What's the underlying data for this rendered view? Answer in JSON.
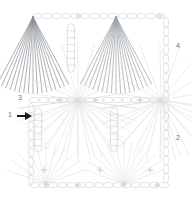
{
  "document": {
    "kind": "crochet-stitch-chart",
    "background_color": "#ffffff"
  },
  "colors": {
    "light_stitch": "#d9dce0",
    "mid_stitch": "#c6cace",
    "dark_stitch": "#9ba0a6",
    "darkest_stitch": "#8a8f95",
    "label_text": "#6f6f6f",
    "arrow": "#1a1a1a"
  },
  "labels": [
    {
      "id": "round-4",
      "text": "4",
      "x": 176,
      "y": 42
    },
    {
      "id": "round-3",
      "text": "3",
      "x": 18,
      "y": 94
    },
    {
      "id": "round-1",
      "text": "1",
      "x": 8,
      "y": 111
    },
    {
      "id": "round-2",
      "text": "2",
      "x": 176,
      "y": 134
    }
  ],
  "markers": [
    {
      "id": "start-arrow",
      "name": "start-direction-arrow",
      "x": 17,
      "y": 116,
      "direction": "right"
    }
  ],
  "chart_data": {
    "type": "diagram",
    "title": "",
    "xlabel": "",
    "ylabel": "",
    "rounds": [
      {
        "number": 1,
        "label": "1",
        "position": "left-middle",
        "note": "start round, marked by arrow"
      },
      {
        "number": 2,
        "label": "2",
        "position": "right-bottom",
        "note": ""
      },
      {
        "number": 3,
        "label": "3",
        "position": "left-upper",
        "note": ""
      },
      {
        "number": 4,
        "label": "4",
        "position": "right-upper",
        "note": ""
      }
    ],
    "fan_centers": [
      {
        "id": "fan-top-left",
        "x": 33,
        "y": 17,
        "spread": "down",
        "rays": 17,
        "tone": "dark"
      },
      {
        "id": "fan-top-right",
        "x": 116,
        "y": 17,
        "spread": "down",
        "rays": 17,
        "tone": "mid"
      },
      {
        "id": "fan-mid-left",
        "x": 78,
        "y": 100,
        "spread": "all",
        "rays": 22,
        "tone": "light"
      },
      {
        "id": "fan-mid-right",
        "x": 161,
        "y": 100,
        "spread": "all",
        "rays": 18,
        "tone": "light"
      },
      {
        "id": "fan-bottom-left",
        "x": 46,
        "y": 184,
        "spread": "up",
        "rays": 11,
        "tone": "light"
      },
      {
        "id": "fan-bottom-right",
        "x": 124,
        "y": 184,
        "spread": "up",
        "rays": 13,
        "tone": "light"
      }
    ],
    "chain_rows": [
      {
        "id": "chain-row-top",
        "y": 16,
        "x1": 33,
        "x2": 165,
        "links": 14
      },
      {
        "id": "chain-row-middle",
        "y": 100,
        "x1": 30,
        "x2": 168,
        "links": 15
      },
      {
        "id": "chain-row-bottom",
        "y": 185,
        "x1": 30,
        "x2": 168,
        "links": 15
      }
    ],
    "chain_columns": [
      {
        "id": "chain-col-left",
        "x": 31,
        "y1": 104,
        "y2": 184,
        "links": 9
      },
      {
        "id": "chain-col-right",
        "x": 166,
        "y1": 18,
        "y2": 100,
        "links": 9
      },
      {
        "id": "chain-col-right-lower",
        "x": 166,
        "y1": 104,
        "y2": 182,
        "links": 9
      }
    ],
    "post_stitches": [
      {
        "id": "post-upper-center",
        "x": 71,
        "y1": 24,
        "y2": 72,
        "bars": 6
      },
      {
        "id": "post-lower-left",
        "x": 38,
        "y1": 108,
        "y2": 152,
        "bars": 6
      },
      {
        "id": "post-lower-center",
        "x": 114,
        "y1": 108,
        "y2": 152,
        "bars": 6
      }
    ],
    "plus_marks": [
      {
        "x": 78,
        "y": 16
      },
      {
        "x": 160,
        "y": 16
      },
      {
        "x": 60,
        "y": 100
      },
      {
        "x": 96,
        "y": 100
      },
      {
        "x": 140,
        "y": 100
      },
      {
        "x": 46,
        "y": 185
      },
      {
        "x": 78,
        "y": 185
      },
      {
        "x": 124,
        "y": 185
      },
      {
        "x": 157,
        "y": 185
      },
      {
        "x": 44,
        "y": 170
      },
      {
        "x": 100,
        "y": 170
      },
      {
        "x": 150,
        "y": 170
      }
    ],
    "legend": [],
    "grid": false
  }
}
